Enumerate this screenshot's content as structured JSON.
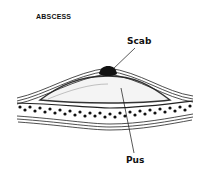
{
  "diagram": {
    "title": "ABSCESS",
    "labels": [
      {
        "id": "scab",
        "text": "Scab"
      },
      {
        "id": "pus",
        "text": "Pus"
      }
    ]
  }
}
